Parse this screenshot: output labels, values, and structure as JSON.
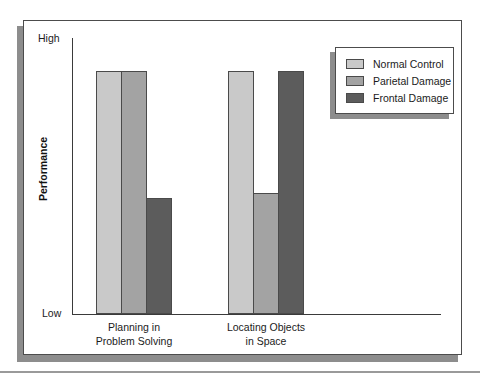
{
  "chart_data": {
    "type": "bar",
    "title": "",
    "xlabel": "",
    "ylabel": "Performance",
    "categories": [
      "Planning in Problem Solving",
      "Locating Objects in Space"
    ],
    "category_lines": [
      [
        "Planning in",
        "Problem Solving"
      ],
      [
        "Locating Objects",
        "in Space"
      ]
    ],
    "ytick_labels": [
      "High",
      "Low"
    ],
    "ylim": [
      0,
      100
    ],
    "y_axis_qualitative": true,
    "grid": false,
    "legend_position": "top-right",
    "series": [
      {
        "name": "Normal Control",
        "color": "#c9c9c9",
        "values": [
          88,
          88
        ]
      },
      {
        "name": "Parietal Damage",
        "color": "#a3a3a3",
        "values": [
          88,
          44
        ]
      },
      {
        "name": "Frontal Damage",
        "color": "#5c5c5c",
        "values": [
          42,
          88
        ]
      }
    ]
  },
  "axes": {
    "y_title": "Performance",
    "y_top_label": "High",
    "y_bottom_label": "Low"
  },
  "legend": {
    "items": [
      {
        "label": "Normal Control",
        "color": "#c9c9c9"
      },
      {
        "label": "Parietal Damage",
        "color": "#a3a3a3"
      },
      {
        "label": "Frontal Damage",
        "color": "#5c5c5c"
      }
    ]
  },
  "categories": [
    {
      "line1": "Planning in",
      "line2": "Problem Solving"
    },
    {
      "line1": "Locating Objects",
      "line2": "in Space"
    }
  ]
}
